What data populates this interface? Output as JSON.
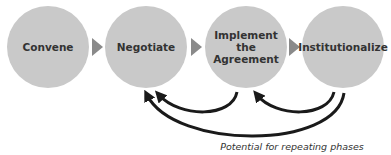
{
  "diagram": {
    "type": "process-flow",
    "phases": [
      {
        "label": "Convene"
      },
      {
        "label": "Negotiate"
      },
      {
        "label": "Implement the Agreement"
      },
      {
        "label": "Institutionalize"
      }
    ],
    "loop_arrows": [
      {
        "from": "Implement the Agreement",
        "to": "Negotiate"
      },
      {
        "from": "Institutionalize",
        "to": "Implement the Agreement"
      },
      {
        "from": "Institutionalize",
        "to": "Negotiate"
      }
    ],
    "caption": "Potential for repeating phases",
    "colors": {
      "circle_fill": "#c9c9c9",
      "connector": "#8a8a8a",
      "loop_arrow": "#1a1a1a",
      "text": "#333333"
    }
  }
}
